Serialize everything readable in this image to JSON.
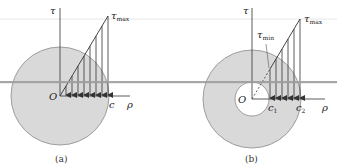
{
  "figure": {
    "colors": {
      "shaft_fill": "#d9d9d9",
      "shaft_stroke": "#8a8a8a",
      "line": "#333333",
      "overlay_bar": "#9c9c9c",
      "faint_line": "#e4e4e4"
    },
    "panels": [
      {
        "id": "a",
        "caption": "(a)",
        "type": "solid shaft",
        "labels": {
          "tau_axis": "τ",
          "tau_max": "τ",
          "tau_max_sub": "max",
          "origin": "O",
          "outer_radius": "c",
          "rho_axis": "ρ"
        },
        "arrow_count": 8
      },
      {
        "id": "b",
        "caption": "(b)",
        "type": "hollow shaft",
        "labels": {
          "tau_axis": "τ",
          "tau_max": "τ",
          "tau_max_sub": "max",
          "tau_min": "τ",
          "tau_min_sub": "min",
          "origin": "O",
          "inner_radius": "c",
          "inner_radius_sub": "1",
          "outer_radius": "c",
          "outer_radius_sub": "2",
          "rho_axis": "ρ"
        },
        "arrow_count": 6
      }
    ]
  }
}
